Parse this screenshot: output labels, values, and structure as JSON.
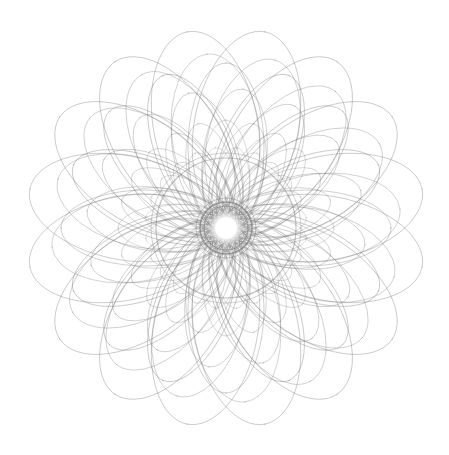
{
  "image": {
    "subject": "spirograph-rosette",
    "background": "#ffffff",
    "stroke_color": "#7a7a7a",
    "center": [
      226,
      228
    ],
    "outer_radius": 200,
    "symmetry": 16,
    "core_ring_radius": 26
  }
}
